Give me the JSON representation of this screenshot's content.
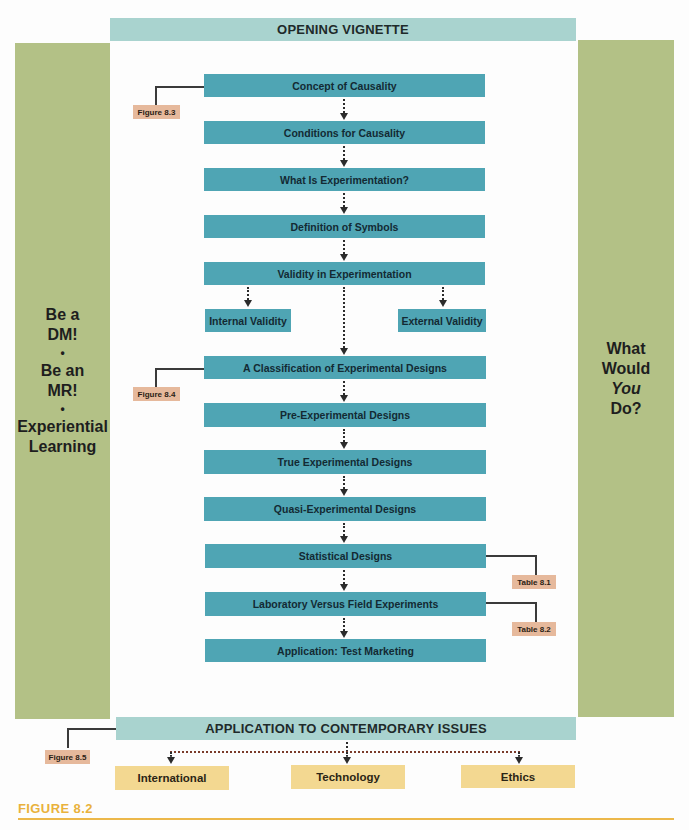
{
  "header": {
    "opening_vignette": "OPENING VIGNETTE"
  },
  "left_panel": {
    "line1": "Be a",
    "line2": "DM!",
    "bullet1": "•",
    "line3": "Be an",
    "line4": "MR!",
    "bullet2": "•",
    "line5": "Experiential",
    "line6": "Learning"
  },
  "right_panel": {
    "line1": "What",
    "line2": "Would",
    "line3": "You",
    "line4": "Do?"
  },
  "flow": {
    "steps": [
      "Concept of Causality",
      "Conditions for Causality",
      "What Is Experimentation?",
      "Definition of Symbols",
      "Validity in Experimentation",
      "A Classification of Experimental Designs",
      "Pre-Experimental Designs",
      "True Experimental Designs",
      "Quasi-Experimental Designs",
      "Statistical Designs",
      "Laboratory Versus Field Experiments",
      "Application: Test Marketing"
    ],
    "validity_branches": {
      "internal": "Internal Validity",
      "external": "External Validity"
    }
  },
  "references": {
    "figure_8_3": "Figure 8.3",
    "figure_8_4": "Figure 8.4",
    "figure_8_5": "Figure 8.5",
    "table_8_1": "Table 8.1",
    "table_8_2": "Table 8.2"
  },
  "footer": {
    "contemporary_issues": "APPLICATION TO CONTEMPORARY ISSUES",
    "issues": [
      "International",
      "Technology",
      "Ethics"
    ]
  },
  "caption": "FIGURE 8.2",
  "colors": {
    "flow_box": "#4fa5b4",
    "header_bar": "#a9d3cf",
    "side_panel": "#b3c186",
    "issue_box": "#f3d891",
    "reference_tag": "#e6b99c",
    "caption": "#e9b23c"
  }
}
